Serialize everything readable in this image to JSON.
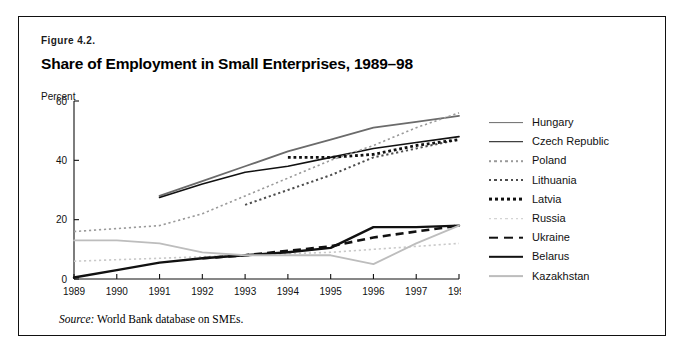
{
  "figure": {
    "number_prefix": "F",
    "number_rest": "IGURE",
    "number_value": " 4.2.",
    "number_full": "Figure 4.2.",
    "title": "Share of Employment in Small Enterprises, 1989–98",
    "source_label": "Source:",
    "source_text": " World Bank database on SMEs."
  },
  "colors": {
    "black": "#111111",
    "dark_gray": "#4d4d4d",
    "mid_gray": "#777777",
    "light_gray": "#b8b8b8",
    "very_light_gray": "#cccccc",
    "border": "#111111",
    "background": "#ffffff"
  },
  "legend": {
    "position": "right",
    "items": [
      {
        "label": "Hungary",
        "style": "solid",
        "color": "#6b6b6b",
        "width": 1.8
      },
      {
        "label": "Czech Republic",
        "style": "solid",
        "color": "#111111",
        "width": 1.6
      },
      {
        "label": "Poland",
        "style": "dotted",
        "color": "#9a9a9a",
        "width": 1.6
      },
      {
        "label": "Lithuania",
        "style": "dotted",
        "color": "#4d4d4d",
        "width": 2.0
      },
      {
        "label": "Latvia",
        "style": "dotted-bold",
        "color": "#111111",
        "width": 2.8
      },
      {
        "label": "Russia",
        "style": "dotted",
        "color": "#c9c9c9",
        "width": 1.6
      },
      {
        "label": "Ukraine",
        "style": "dashed",
        "color": "#111111",
        "width": 2.6
      },
      {
        "label": "Belarus",
        "style": "solid",
        "color": "#111111",
        "width": 2.4
      },
      {
        "label": "Kazakhstan",
        "style": "solid",
        "color": "#bdbdbd",
        "width": 1.8
      }
    ]
  },
  "chart_data": {
    "type": "line",
    "title": "Share of Employment in Small Enterprises, 1989–98",
    "xlabel": "",
    "ylabel": "Percent",
    "ylabel_display": "Percent",
    "x": [
      1989,
      1990,
      1991,
      1992,
      1993,
      1994,
      1995,
      1996,
      1997,
      1998
    ],
    "xlim": [
      1989,
      1998
    ],
    "ylim": [
      0,
      60
    ],
    "yticks": [
      0,
      20,
      40,
      60
    ],
    "xticks": [
      1989,
      1990,
      1991,
      1992,
      1993,
      1994,
      1995,
      1996,
      1997,
      1998
    ],
    "grid": false,
    "legend_position": "right",
    "series": [
      {
        "name": "Hungary",
        "color": "#6b6b6b",
        "style": "solid",
        "width": 1.8,
        "x": [
          1991,
          1992,
          1993,
          1994,
          1995,
          1996,
          1997,
          1998
        ],
        "values": [
          28,
          33,
          38,
          43,
          47,
          51,
          53,
          55
        ]
      },
      {
        "name": "Czech Republic",
        "color": "#111111",
        "style": "solid",
        "width": 1.6,
        "x": [
          1991,
          1992,
          1993,
          1994,
          1995,
          1996,
          1997,
          1998
        ],
        "values": [
          27.5,
          32,
          36,
          38,
          41,
          44,
          46,
          48
        ]
      },
      {
        "name": "Poland",
        "color": "#9a9a9a",
        "style": "dotted",
        "width": 1.6,
        "x": [
          1989,
          1990,
          1991,
          1992,
          1993,
          1994,
          1995,
          1996,
          1997,
          1998
        ],
        "values": [
          16,
          17,
          18,
          22,
          28,
          34,
          40,
          45,
          51,
          56
        ]
      },
      {
        "name": "Lithuania",
        "color": "#4d4d4d",
        "style": "dotted",
        "width": 2.0,
        "x": [
          1993,
          1994,
          1995,
          1996,
          1997,
          1998
        ],
        "values": [
          25,
          30,
          35,
          41,
          44,
          47
        ]
      },
      {
        "name": "Latvia",
        "color": "#111111",
        "style": "dotted-bold",
        "width": 2.8,
        "x": [
          1994,
          1995,
          1996,
          1997,
          1998
        ],
        "values": [
          41,
          41,
          42,
          45,
          47
        ]
      },
      {
        "name": "Russia",
        "color": "#c9c9c9",
        "style": "dotted",
        "width": 1.6,
        "x": [
          1989,
          1990,
          1991,
          1992,
          1993,
          1994,
          1995,
          1996,
          1997,
          1998
        ],
        "values": [
          6,
          6.5,
          7,
          7.5,
          8,
          8.5,
          9,
          10,
          11,
          12
        ]
      },
      {
        "name": "Ukraine",
        "color": "#111111",
        "style": "dashed",
        "width": 2.6,
        "x": [
          1992,
          1993,
          1994,
          1995,
          1996,
          1997,
          1998
        ],
        "values": [
          7,
          8,
          9.5,
          11,
          14,
          16,
          18
        ]
      },
      {
        "name": "Belarus",
        "color": "#111111",
        "style": "solid",
        "width": 2.4,
        "x": [
          1989,
          1990,
          1991,
          1992,
          1993,
          1994,
          1995,
          1996,
          1997,
          1998
        ],
        "values": [
          0.5,
          3,
          5.5,
          7,
          8,
          9,
          10.5,
          17.5,
          17.5,
          18
        ]
      },
      {
        "name": "Kazakhstan",
        "color": "#bdbdbd",
        "style": "solid",
        "width": 1.8,
        "x": [
          1989,
          1990,
          1991,
          1992,
          1993,
          1994,
          1995,
          1996,
          1997,
          1998
        ],
        "values": [
          13,
          13,
          12,
          9,
          8,
          8,
          8,
          5,
          12,
          18
        ]
      }
    ]
  }
}
